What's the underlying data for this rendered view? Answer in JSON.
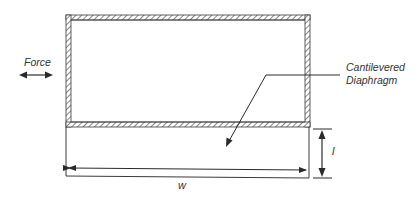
{
  "diagram": {
    "type": "engineering-schematic",
    "labels": {
      "force": "Force",
      "diaphragm_line1": "Cantilevered",
      "diaphragm_line2": "Diaphragm",
      "width": "w",
      "length": "l"
    },
    "colors": {
      "stroke": "#3a3a3a",
      "hatch": "#555555",
      "text": "#333333",
      "background": "#ffffff"
    }
  }
}
